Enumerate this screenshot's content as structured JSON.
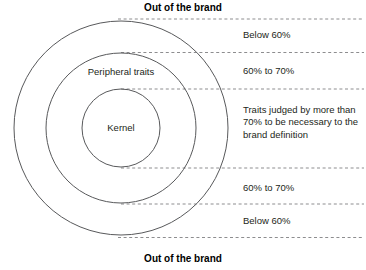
{
  "diagram": {
    "title_top": "Out of the brand",
    "title_bottom": "Out of the brand",
    "circles": [
      {
        "name": "outer",
        "label": "",
        "cx": 121,
        "cy": 128,
        "r": 107
      },
      {
        "name": "middle",
        "label": "Peripheral traits",
        "cx": 121,
        "cy": 128,
        "r": 75
      },
      {
        "name": "inner",
        "label": "Kernel",
        "cx": 121,
        "cy": 128,
        "r": 39
      }
    ],
    "circle_labels": {
      "middle": "Peripheral traits",
      "inner": "Kernel"
    },
    "bands": [
      {
        "id": "band-0",
        "text": "Below 60%"
      },
      {
        "id": "band-1",
        "text": "60% to 70%"
      },
      {
        "id": "band-2",
        "text": "Traits judged by more than 70% to be necessary to the brand definition"
      },
      {
        "id": "band-3",
        "text": "60% to 70%"
      },
      {
        "id": "band-4",
        "text": "Below 60%"
      }
    ],
    "guide_lines_y": [
      19,
      52.5,
      89,
      168,
      204,
      237.5
    ],
    "colors": {
      "stroke": "#58595b",
      "dash": "#8d8d8f",
      "text": "#231f20",
      "background": "#ffffff"
    }
  }
}
